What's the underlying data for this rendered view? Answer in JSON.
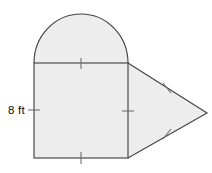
{
  "figure": {
    "fill_color": "#ededed",
    "stroke_color": "#444444",
    "tick_color": "#6b6b6b",
    "background_color": "#ffffff",
    "labels": [
      {
        "name": "left-side-dimension",
        "text": "8 ft",
        "x": 8,
        "y": 114,
        "describes": "left side of square"
      }
    ],
    "parts": {
      "square": {
        "name": "square",
        "left": 34,
        "top": 63,
        "right": 128,
        "bottom": 158,
        "width": 94,
        "height": 95,
        "side_length_label": "8 ft"
      },
      "semicircle": {
        "name": "semicircle",
        "center_x": 81,
        "center_y": 63,
        "radius_x": 47,
        "radius_y": 49,
        "apex_y": 14,
        "sits_on": "top edge of square"
      },
      "triangle": {
        "name": "triangle",
        "vertices": [
          {
            "x": 128,
            "y": 63
          },
          {
            "x": 207,
            "y": 113
          },
          {
            "x": 128,
            "y": 158
          }
        ],
        "attached_to": "right edge of square"
      }
    },
    "tick_marks": [
      {
        "name": "tick-square-top",
        "x1": 81,
        "y1": 58,
        "x2": 81,
        "y2": 69
      },
      {
        "name": "tick-square-bottom",
        "x1": 81,
        "y1": 152,
        "x2": 81,
        "y2": 164
      },
      {
        "name": "tick-square-left",
        "x1": 28,
        "y1": 110,
        "x2": 40,
        "y2": 110
      },
      {
        "name": "tick-square-right",
        "x1": 122,
        "y1": 111,
        "x2": 134,
        "y2": 111
      },
      {
        "name": "tick-triangle-upper",
        "x1": 163,
        "y1": 83,
        "x2": 171,
        "y2": 93
      },
      {
        "name": "tick-triangle-lower",
        "x1": 163,
        "y1": 139,
        "x2": 171,
        "y2": 129
      }
    ]
  }
}
